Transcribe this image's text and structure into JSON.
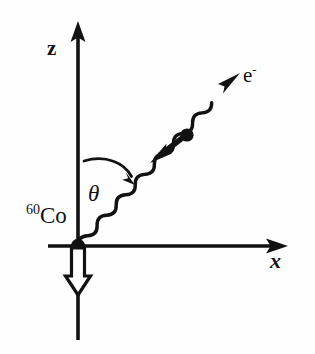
{
  "figure": {
    "background_color": "#fefefe",
    "ink_color": "#121212"
  },
  "axes": {
    "vertical": {
      "label": "z",
      "name": "z-axis",
      "arrow_direction": "up"
    },
    "horizontal": {
      "label": "x",
      "name": "x-axis",
      "arrow_direction": "right"
    },
    "origin_marker": "nucleus-dot"
  },
  "annotations": {
    "nucleus": {
      "mass_number": "60",
      "element_symbol": "Co",
      "full_label": "60Co"
    },
    "angle": {
      "symbol": "θ",
      "description": "angle between z-axis and emitted electron direction"
    },
    "electron": {
      "symbol": "e",
      "charge": "-",
      "full_label": "e-"
    },
    "nuclear_spin_arrow": {
      "name": "nuclear-spin-arrow",
      "style": "hollow-outline",
      "direction": "down"
    },
    "electron_spin_arrow": {
      "name": "electron-spin-arrow",
      "style": "solid-filled",
      "direction": "down-left"
    },
    "electron_track": {
      "name": "electron-wavy-track",
      "style": "wavy",
      "direction": "up-right"
    },
    "angle_arc": {
      "name": "angle-arc",
      "style": "curved-arrow"
    }
  }
}
